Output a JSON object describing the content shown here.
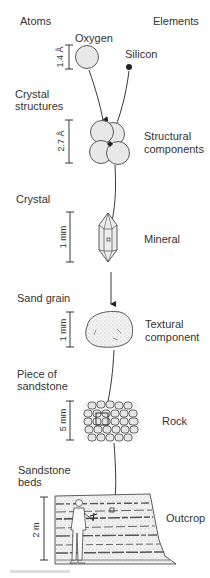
{
  "header": {
    "left_column": "Atoms",
    "right_column": "Elements"
  },
  "levels": [
    {
      "id": "atoms",
      "left_label": [
        "Atoms"
      ],
      "items": [
        "Oxygen",
        "Silicon"
      ],
      "scale": "1.4 Å",
      "right_label": [
        "Elements"
      ]
    },
    {
      "id": "crystal-structures",
      "left_label": [
        "Crystal",
        "structures"
      ],
      "scale": "2.7 Å",
      "right_label": [
        "Structural",
        "components"
      ]
    },
    {
      "id": "crystal",
      "left_label": [
        "Crystal"
      ],
      "scale": "1 mm",
      "right_label": [
        "Mineral"
      ]
    },
    {
      "id": "sand-grain",
      "left_label": [
        "Sand grain"
      ],
      "scale": "1 mm",
      "right_label": [
        "Textural",
        "component"
      ]
    },
    {
      "id": "sandstone-piece",
      "left_label": [
        "Piece of",
        "sandstone"
      ],
      "scale": "5 mm",
      "right_label": [
        "Rock"
      ]
    },
    {
      "id": "sandstone-beds",
      "left_label": [
        "Sandstone",
        "beds"
      ],
      "scale": "2 m",
      "right_label": [
        "Outcrop"
      ]
    }
  ],
  "labels": {
    "oxygen": "Oxygen",
    "silicon": "Silicon",
    "crystal_structures_1": "Crystal",
    "crystal_structures_2": "structures",
    "structural_1": "Structural",
    "structural_2": "components",
    "crystal": "Crystal",
    "mineral": "Mineral",
    "sand_grain": "Sand grain",
    "textural_1": "Textural",
    "textural_2": "component",
    "piece_1": "Piece of",
    "piece_2": "sandstone",
    "rock": "Rock",
    "beds_1": "Sandstone",
    "beds_2": "beds",
    "outcrop": "Outcrop"
  },
  "scales": {
    "oxygen": "1.4 Å",
    "crystal_structure": "2.7 Å",
    "crystal": "1 mm",
    "sand_grain": "1 mm",
    "sandstone": "5 mm",
    "outcrop": "2 m"
  },
  "colors": {
    "atom_fill": "#e8e8e8",
    "ink": "#222222",
    "text": "#333333"
  }
}
